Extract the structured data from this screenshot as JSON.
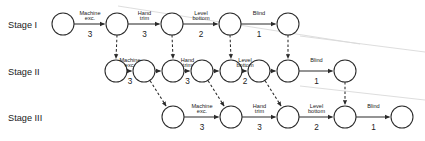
{
  "figure": {
    "background": "#ffffff",
    "ink_color": "#2b2b2b"
  },
  "stages": [
    {
      "id": "stage-1",
      "label": "Stage I",
      "label_x": 8,
      "label_y": 28,
      "row_y": 24
    },
    {
      "id": "stage-2",
      "label": "Stage II",
      "label_x": 8,
      "label_y": 75,
      "row_y": 71
    },
    {
      "id": "stage-3",
      "label": "Stage III",
      "label_x": 8,
      "label_y": 121,
      "row_y": 117
    }
  ],
  "node_radius": 11,
  "nodes": [
    {
      "id": "s1-n1",
      "stage": 0,
      "cx": 63,
      "cy": 24
    },
    {
      "id": "s1-n2",
      "stage": 0,
      "cx": 117,
      "cy": 24
    },
    {
      "id": "s1-n3",
      "stage": 0,
      "cx": 172,
      "cy": 24
    },
    {
      "id": "s1-n4",
      "stage": 0,
      "cx": 230,
      "cy": 24
    },
    {
      "id": "s1-n5",
      "stage": 0,
      "cx": 288,
      "cy": 24
    },
    {
      "id": "s2-n1",
      "stage": 1,
      "cx": 116,
      "cy": 71
    },
    {
      "id": "s2-n2",
      "stage": 1,
      "cx": 144,
      "cy": 71
    },
    {
      "id": "s2-n3",
      "stage": 1,
      "cx": 173,
      "cy": 71
    },
    {
      "id": "s2-n4",
      "stage": 1,
      "cx": 202,
      "cy": 71
    },
    {
      "id": "s2-n5",
      "stage": 1,
      "cx": 231,
      "cy": 71
    },
    {
      "id": "s2-n6",
      "stage": 1,
      "cx": 259,
      "cy": 71
    },
    {
      "id": "s2-n7",
      "stage": 1,
      "cx": 288,
      "cy": 71
    },
    {
      "id": "s2-n8",
      "stage": 1,
      "cx": 345,
      "cy": 71
    },
    {
      "id": "s3-n1",
      "stage": 2,
      "cx": 173,
      "cy": 117
    },
    {
      "id": "s3-n2",
      "stage": 2,
      "cx": 231,
      "cy": 117
    },
    {
      "id": "s3-n3",
      "stage": 2,
      "cx": 288,
      "cy": 117
    },
    {
      "id": "s3-n4",
      "stage": 2,
      "cx": 345,
      "cy": 117
    },
    {
      "id": "s3-n5",
      "stage": 2,
      "cx": 402,
      "cy": 117
    }
  ],
  "activities": [
    {
      "id": "a-s1-1",
      "stage": "Stage I",
      "from": "s1-n1",
      "to": "s1-n2",
      "name": "Machine exc.",
      "name_line1": "Machine",
      "name_line2": "exc.",
      "duration": 3
    },
    {
      "id": "a-s1-2",
      "stage": "Stage I",
      "from": "s1-n2",
      "to": "s1-n3",
      "name": "Hand trim",
      "name_line1": "Hand",
      "name_line2": "trim",
      "duration": 3
    },
    {
      "id": "a-s1-3",
      "stage": "Stage I",
      "from": "s1-n3",
      "to": "s1-n4",
      "name": "Level bottom",
      "name_line1": "Level",
      "name_line2": "bottom",
      "duration": 2
    },
    {
      "id": "a-s1-4",
      "stage": "Stage I",
      "from": "s1-n4",
      "to": "s1-n5",
      "name": "Blind",
      "name_line1": "Blind",
      "name_line2": "",
      "duration": 1
    },
    {
      "id": "a-s2-1",
      "stage": "Stage II",
      "from": "s2-n1",
      "to": "s2-n2",
      "name": "Machine exc.",
      "name_line1": "Machine",
      "name_line2": "exc.",
      "duration": 3
    },
    {
      "id": "a-s2-2",
      "stage": "Stage II",
      "from": "s2-n2",
      "to": "s2-n3",
      "name": "",
      "name_line1": "",
      "name_line2": "",
      "duration": null
    },
    {
      "id": "a-s2-3",
      "stage": "Stage II",
      "from": "s2-n3",
      "to": "s2-n4",
      "name": "Hand trim",
      "name_line1": "Hand",
      "name_line2": "trim",
      "duration": 3
    },
    {
      "id": "a-s2-4",
      "stage": "Stage II",
      "from": "s2-n4",
      "to": "s2-n5",
      "name": "",
      "name_line1": "",
      "name_line2": "",
      "duration": null
    },
    {
      "id": "a-s2-5",
      "stage": "Stage II",
      "from": "s2-n5",
      "to": "s2-n6",
      "name": "Level bottom",
      "name_line1": "Level",
      "name_line2": "bottom",
      "duration": 2
    },
    {
      "id": "a-s2-6",
      "stage": "Stage II",
      "from": "s2-n6",
      "to": "s2-n7",
      "name": "",
      "name_line1": "",
      "name_line2": "",
      "duration": null
    },
    {
      "id": "a-s2-7",
      "stage": "Stage II",
      "from": "s2-n7",
      "to": "s2-n8",
      "name": "Blind",
      "name_line1": "Blind",
      "name_line2": "",
      "duration": 1
    },
    {
      "id": "a-s3-1",
      "stage": "Stage III",
      "from": "s3-n1",
      "to": "s3-n2",
      "name": "Machine exc.",
      "name_line1": "Machine",
      "name_line2": "exc.",
      "duration": 3
    },
    {
      "id": "a-s3-2",
      "stage": "Stage III",
      "from": "s3-n2",
      "to": "s3-n3",
      "name": "Hand trim",
      "name_line1": "Hand",
      "name_line2": "trim",
      "duration": 3
    },
    {
      "id": "a-s3-3",
      "stage": "Stage III",
      "from": "s3-n3",
      "to": "s3-n4",
      "name": "Level bottom",
      "name_line1": "Level",
      "name_line2": "bottom",
      "duration": 2
    },
    {
      "id": "a-s3-4",
      "stage": "Stage III",
      "from": "s3-n4",
      "to": "s3-n5",
      "name": "Blind",
      "name_line1": "Blind",
      "name_line2": "",
      "duration": 1
    }
  ],
  "dependency_links": [
    {
      "id": "d-1",
      "from": "s1-n2",
      "to": "s2-n1",
      "style": "dashed",
      "kind": "vertical"
    },
    {
      "id": "d-2",
      "from": "s1-n3",
      "to": "s2-n3",
      "style": "dashed",
      "kind": "vertical"
    },
    {
      "id": "d-3",
      "from": "s1-n4",
      "to": "s2-n5",
      "style": "dashed",
      "kind": "vertical"
    },
    {
      "id": "d-4",
      "from": "s1-n5",
      "to": "s2-n7",
      "style": "dashed",
      "kind": "vertical"
    },
    {
      "id": "d-5",
      "from": "s2-n2",
      "to": "s3-n1",
      "style": "dashed",
      "kind": "diagonal"
    },
    {
      "id": "d-6",
      "from": "s2-n4",
      "to": "s3-n2",
      "style": "dashed",
      "kind": "diagonal"
    },
    {
      "id": "d-7",
      "from": "s2-n6",
      "to": "s3-n3",
      "style": "dashed",
      "kind": "diagonal"
    },
    {
      "id": "d-8",
      "from": "s2-n8",
      "to": "s3-n4",
      "style": "dashed",
      "kind": "vertical"
    }
  ],
  "legend_note": ""
}
